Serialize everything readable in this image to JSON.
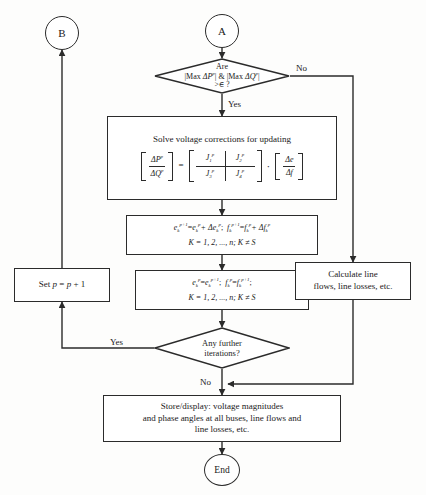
{
  "diagram": {
    "type": "flowchart"
  },
  "connectors": {
    "b_label": "B",
    "a_label": "A",
    "end_label": "End"
  },
  "decision_top": {
    "line1": "Are",
    "line2_a": "|Max ",
    "line2_delta": "Δ",
    "line2_p": "P",
    "line2_sup": "p",
    "line2_mid": "| & |Max ",
    "line2_q": "Q",
    "line3": ">∈ ?",
    "yes_label": "Yes",
    "no_label": "No"
  },
  "solve_box": {
    "heading": "Solve voltage corrections for updating",
    "lhs_row1": "ΔP",
    "lhs_row1_sup": "p",
    "lhs_row2": "ΔQ",
    "lhs_row2_sup": "p",
    "equals": "=",
    "j1": "J",
    "j1_sub": "1",
    "j1_sup": "p",
    "j2": "J",
    "j2_sub": "2",
    "j2_sup": "p",
    "j3": "J",
    "j3_sub": "3",
    "j3_sup": "p",
    "j4": "J",
    "j4_sub": "4",
    "j4_sup": "p",
    "dot": "·",
    "rhs_row1": "Δe",
    "rhs_row2": "Δf"
  },
  "update_box": {
    "line1_part1_e": "e",
    "line1_part1_sub": "k",
    "line1_part1_sup": "p+1",
    "line1_eq": "=",
    "line1_e2": "e",
    "line1_e2_sub": "k",
    "line1_e2_sup": "p",
    "line1_plus": "+ Δe",
    "line1_de_sub": "k",
    "line1_de_sup": "p",
    "line1_semi": ";",
    "line1_f": "f",
    "line1_f_sub": "k",
    "line1_f_sup": "p+1",
    "line1_f2": "f",
    "line1_f2_sub": "k",
    "line1_f2_sup": "p",
    "line1_fplus": "+ Δf",
    "line1_df_sub": "k",
    "line1_df_sup": "p",
    "line2": "K = 1, 2, ..., n;  K ≠ S"
  },
  "copy_box": {
    "line1_e": "e",
    "line1_e_sub": "k",
    "line1_e_sup": "p",
    "line1_eq": "=",
    "line1_e2": "e",
    "line1_e2_sub": "k",
    "line1_e2_sup": "p+1",
    "line1_semi1": ";",
    "line1_f": "f",
    "line1_f_sub": "k",
    "line1_f_sup": "p",
    "line1_f2": "f",
    "line1_f2_sub": "k",
    "line1_f2_sup": "p+1",
    "line1_semi2": ";",
    "line2": "K = 1, 2, ..., n;  K ≠ S"
  },
  "set_p_box": {
    "text_pre": "Set ",
    "text_p": "p",
    "text_eq": " = ",
    "text_p2": "p",
    "text_post": " + 1"
  },
  "calc_box": {
    "line1": "Calculate line",
    "line2": "flows, line losses, etc."
  },
  "decision_bottom": {
    "line1": "Any further",
    "line2": "iterations?",
    "yes_label": "Yes",
    "no_label": "No"
  },
  "store_box": {
    "line1": "Store/display: voltage magnitudes",
    "line2": "and phase angles at all buses, line flows and",
    "line3": "line losses, etc."
  },
  "style": {
    "stroke": "#2b2b2b",
    "background": "#fdfdfc"
  }
}
